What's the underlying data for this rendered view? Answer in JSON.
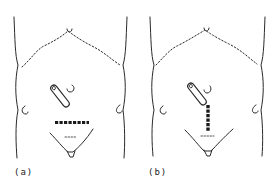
{
  "figure": {
    "panels": [
      {
        "id": "a",
        "label": "(a)",
        "incision_orientation": "horizontal",
        "description": "Abdomen outline with stoma, dotted costal margin and transverse dashed incision"
      },
      {
        "id": "b",
        "label": "(b)",
        "incision_orientation": "vertical",
        "description": "Abdomen outline with stoma, dotted costal margin and vertical dashed incision"
      }
    ],
    "colors": {
      "line": "#2a2a2a",
      "background": "#ffffff"
    }
  }
}
